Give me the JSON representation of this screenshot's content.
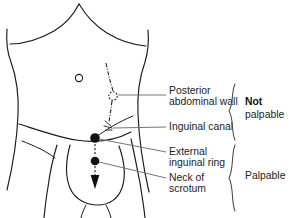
{
  "figure": {
    "kind": "anatomical-line-diagram",
    "background_color": "#ffffff",
    "ink_color": "#1a1a1a",
    "leader_color": "#6e6e6e"
  },
  "anatomy_markers": [
    {
      "id": "umbilicus",
      "name": "umbilicus",
      "style": "open-circle",
      "x": 79,
      "y": 78,
      "r": 3.6
    },
    {
      "id": "deep-inguinal-ring",
      "name": "deep inguinal ring",
      "style": "dashed-circle",
      "x": 113,
      "y": 96,
      "r": 4.2
    },
    {
      "id": "external-inguinal-ring",
      "name": "external inguinal ring",
      "style": "filled-dot",
      "x": 95,
      "y": 138,
      "r": 4.6
    },
    {
      "id": "neck-of-scrotum",
      "name": "neck of scrotum",
      "style": "filled-dot",
      "x": 95,
      "y": 161,
      "r": 4.2
    }
  ],
  "labels": [
    {
      "id": "posterior-abdominal-wall",
      "lines": [
        "Posterior",
        "abdominal wall"
      ],
      "text_x": 169,
      "line1_y": 91,
      "line2_y": 102,
      "leader_from_x": 118,
      "leader_from_y": 95,
      "leader_to_x": 166,
      "leader_to_y": 95
    },
    {
      "id": "inguinal-canal",
      "lines": [
        "Inguinal canal"
      ],
      "text_x": 169,
      "line1_y": 127,
      "leader_from_x": 119,
      "leader_from_y": 127,
      "leader_to_x": 166,
      "leader_to_y": 127
    },
    {
      "id": "external-inguinal-ring",
      "lines": [
        "External",
        "inguinal ring"
      ],
      "text_x": 169,
      "line1_y": 152,
      "line2_y": 163,
      "leader_from_x": 98,
      "leader_from_y": 140,
      "leader_to_x": 166,
      "leader_to_y": 152
    },
    {
      "id": "neck-of-scrotum",
      "lines": [
        "Neck of",
        "scrotum"
      ],
      "text_x": 169,
      "line1_y": 178,
      "line2_y": 189,
      "leader_from_x": 99,
      "leader_from_y": 162,
      "leader_to_x": 166,
      "leader_to_y": 178
    }
  ],
  "groups": [
    {
      "id": "not-palpable",
      "bold_word": "Not",
      "rest_word": "palpable",
      "bold_x": 245,
      "bold_y": 102,
      "rest_x": 245,
      "rest_y": 115,
      "brace_top_y": 84,
      "brace_bottom_y": 140,
      "brace_x": 233
    },
    {
      "id": "palpable",
      "bold_word": "",
      "rest_word": "Palpable",
      "rest_x": 245,
      "rest_y": 176,
      "brace_top_y": 145,
      "brace_bottom_y": 211,
      "brace_x": 233
    }
  ]
}
